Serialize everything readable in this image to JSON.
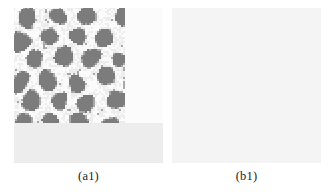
{
  "figure": {
    "background_color": "#ffffff",
    "panel_count": 2,
    "panels": [
      {
        "id": "a1",
        "caption": "(a1)",
        "pattern_type": "hexagonal-spot",
        "description": "gray rounded spots on mottled light background",
        "x": 14,
        "y": 8,
        "width": 149,
        "height": 155
      },
      {
        "id": "b1",
        "caption": "(b1)",
        "pattern_type": "labyrinthine-stripe",
        "description": "gray winding stripes on mottled light background",
        "x": 172,
        "y": 8,
        "width": 149,
        "height": 155
      }
    ]
  },
  "colors": {
    "page_background": "#ffffff",
    "pattern_dark": "#7c7c7c",
    "pattern_mid": "#a8a8a8",
    "pattern_light": "#ededed",
    "pattern_white": "#fbfbfb",
    "caption_text": "#1a1a1a"
  },
  "chart_data": {
    "type": "heatmap",
    "title": "",
    "xlabel": "",
    "ylabel": "",
    "grid": false,
    "legend": "none",
    "panels": [
      {
        "name": "(a1)",
        "type": "heatmap",
        "field": "order-parameter",
        "pattern": "hexagonal spots",
        "grid_size": [
          74,
          77
        ],
        "value_range": [
          0,
          1
        ],
        "spot_centers": [
          [
            0.09,
            0.07
          ],
          [
            0.3,
            0.05
          ],
          [
            0.49,
            0.06
          ],
          [
            0.74,
            0.07
          ],
          [
            0.93,
            0.05
          ],
          [
            0.05,
            0.22
          ],
          [
            0.23,
            0.2
          ],
          [
            0.42,
            0.19
          ],
          [
            0.6,
            0.21
          ],
          [
            0.8,
            0.22
          ],
          [
            0.97,
            0.2
          ],
          [
            0.13,
            0.35
          ],
          [
            0.33,
            0.33
          ],
          [
            0.52,
            0.32
          ],
          [
            0.71,
            0.35
          ],
          [
            0.9,
            0.33
          ],
          [
            0.04,
            0.48
          ],
          [
            0.22,
            0.47
          ],
          [
            0.41,
            0.49
          ],
          [
            0.61,
            0.46
          ],
          [
            0.79,
            0.48
          ],
          [
            0.96,
            0.47
          ],
          [
            0.12,
            0.61
          ],
          [
            0.31,
            0.6
          ],
          [
            0.5,
            0.62
          ],
          [
            0.69,
            0.59
          ],
          [
            0.88,
            0.61
          ],
          [
            0.05,
            0.74
          ],
          [
            0.24,
            0.75
          ],
          [
            0.43,
            0.73
          ],
          [
            0.63,
            0.76
          ],
          [
            0.82,
            0.74
          ],
          [
            0.99,
            0.75
          ],
          [
            0.14,
            0.88
          ],
          [
            0.34,
            0.89
          ],
          [
            0.54,
            0.87
          ],
          [
            0.73,
            0.9
          ],
          [
            0.92,
            0.88
          ]
        ],
        "spot_radius": 0.055,
        "fill_fraction": 0.33
      },
      {
        "name": "(b1)",
        "type": "heatmap",
        "field": "order-parameter",
        "pattern": "labyrinthine stripes",
        "grid_size": [
          74,
          77
        ],
        "value_range": [
          0,
          1
        ],
        "stripe_wavelength": 0.118,
        "fill_fraction": 0.4
      }
    ]
  }
}
